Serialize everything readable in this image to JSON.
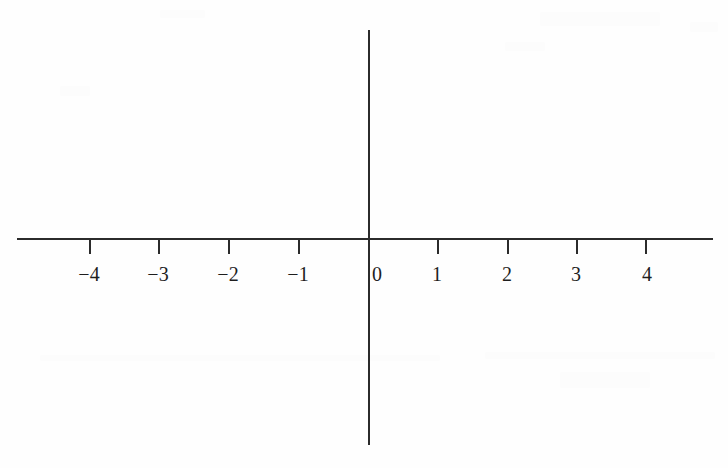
{
  "figure": {
    "kind": "cartesian-axes",
    "title": "",
    "background_color": "#fefefe",
    "line_color": "#2b2b2b",
    "label_color": "#1e1e1e"
  },
  "chart_data": {
    "type": "line",
    "title": "",
    "subtitle": "",
    "xlabel": "",
    "ylabel": "",
    "grid": false,
    "legend": null,
    "series": [],
    "x_axis": {
      "name": "x-axis",
      "orientation": "horizontal",
      "visible_range": [
        -5.05,
        4.96
      ],
      "tick_values": [
        -4,
        -3,
        -2,
        -1,
        0,
        1,
        2,
        3,
        4
      ],
      "tick_labels": [
        "−4",
        "−3",
        "−2",
        "−1",
        "0",
        "1",
        "2",
        "3",
        "4"
      ],
      "tick_interval": 1,
      "tick_direction": "down",
      "minor_ticks": false,
      "arrowheads": false,
      "pixel_origin_x": 368,
      "pixel_per_unit": 69.5,
      "pixel_y": 238,
      "pixel_start_x": 17,
      "pixel_end_x": 713
    },
    "y_axis": {
      "name": "y-axis",
      "orientation": "vertical",
      "tick_values": [],
      "tick_labels": [],
      "minor_ticks": false,
      "arrowheads": false,
      "pixel_x": 368,
      "pixel_start_y": 30,
      "pixel_end_y": 445
    },
    "origin_label": "0",
    "data_points": [],
    "annotations": []
  },
  "ticks": [
    {
      "name": "tick-neg-4",
      "label": "−4",
      "value": -4,
      "x": 89,
      "label_x": 89,
      "label_y": 264
    },
    {
      "name": "tick-neg-3",
      "label": "−3",
      "value": -3,
      "x": 158,
      "label_x": 158,
      "label_y": 264
    },
    {
      "name": "tick-neg-2",
      "label": "−2",
      "value": -2,
      "x": 228,
      "label_x": 228,
      "label_y": 264
    },
    {
      "name": "tick-neg-1",
      "label": "−1",
      "value": -1,
      "x": 298,
      "label_x": 298,
      "label_y": 264
    },
    {
      "name": "tick-zero",
      "label": "0",
      "value": 0,
      "x": 368,
      "label_x": 372,
      "label_y": 264
    },
    {
      "name": "tick-pos-1",
      "label": "1",
      "value": 1,
      "x": 437,
      "label_x": 437,
      "label_y": 264
    },
    {
      "name": "tick-pos-2",
      "label": "2",
      "value": 2,
      "x": 507,
      "label_x": 507,
      "label_y": 264
    },
    {
      "name": "tick-pos-3",
      "label": "3",
      "value": 3,
      "x": 576,
      "label_x": 576,
      "label_y": 264
    },
    {
      "name": "tick-pos-4",
      "label": "4",
      "value": 4,
      "x": 645,
      "label_x": 647,
      "label_y": 264
    }
  ],
  "geometry": {
    "tick_length": 16,
    "axis_line_width": 2,
    "label_font_size": 20,
    "canvas_width": 728,
    "canvas_height": 468
  }
}
